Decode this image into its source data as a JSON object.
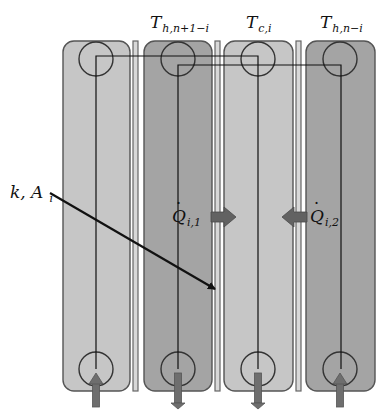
{
  "colors": {
    "light_channel": "#c6c6c6",
    "dark_channel": "#a4a4a4",
    "outline": "#555555",
    "plate_fill": "#d8d8d8",
    "line": "#111111",
    "flow_arrow": "#6e6e6e",
    "heat_arrow": "#626262"
  },
  "labels": {
    "ch2_top": {
      "main": "T",
      "sub": "h,n+1−i"
    },
    "ch3_top": {
      "main": "T",
      "sub": "c,i"
    },
    "ch4_top": {
      "main": "T",
      "sub": "h,n−i"
    },
    "plate": {
      "main": "k, A",
      "sub": "i"
    },
    "heat1": {
      "main": "Q",
      "sub": "i,1"
    },
    "heat2": {
      "main": "Q",
      "sub": "i,2"
    }
  },
  "channels": [
    {
      "id": "ch1",
      "x": 63,
      "width": 67,
      "shade": "light",
      "flow": "up"
    },
    {
      "id": "ch2",
      "x": 144,
      "width": 68,
      "shade": "dark",
      "flow": "down"
    },
    {
      "id": "ch3",
      "x": 224,
      "width": 69,
      "shade": "light",
      "flow": "down"
    },
    {
      "id": "ch4",
      "x": 306,
      "width": 69,
      "shade": "dark",
      "flow": "up"
    }
  ],
  "plates": [
    {
      "x": 133,
      "width": 5
    },
    {
      "x": 215,
      "width": 5
    },
    {
      "x": 296,
      "width": 5
    }
  ],
  "heat_arrows": [
    {
      "direction": "right",
      "y": 217,
      "from_x": 211,
      "to_x": 236
    },
    {
      "direction": "left",
      "y": 217,
      "from_x": 307,
      "to_x": 282
    }
  ]
}
